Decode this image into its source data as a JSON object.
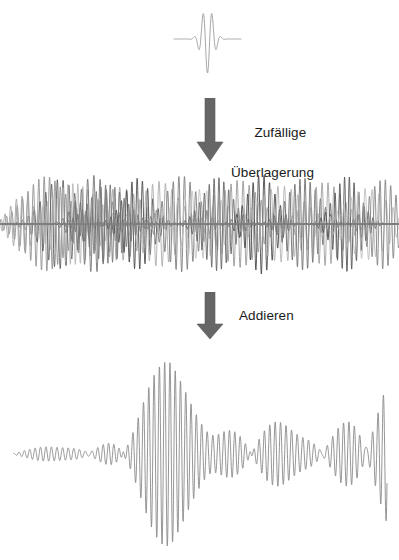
{
  "figure": {
    "background": "#ffffff",
    "width": 399,
    "height": 560
  },
  "labels": {
    "superposition_line1": "Zufällige",
    "superposition_line2": "Überlagerung",
    "add": "Addieren"
  },
  "arrows": {
    "color": "#5e5e5e",
    "shaft_color": "#6b6b6b",
    "first_name": "down-arrow-superposition",
    "second_name": "down-arrow-add"
  },
  "chart_data": {
    "type": "line",
    "xlabel": "",
    "ylabel": "",
    "grid": false,
    "legend": false,
    "panels": [
      {
        "name": "single-wave-packet",
        "description": "Einzelnes Wellenpaket (gaussförmig moduliert)",
        "color": "#9a9a9a",
        "x_range": [
          0,
          1
        ],
        "y_range": [
          -1,
          1
        ],
        "center": 0.5,
        "envelope_width": 0.17,
        "cycles": 7.5,
        "phase": 0.0,
        "amplitude": 1.0,
        "samples": 420
      },
      {
        "name": "random-superposition-band",
        "description": "Viele zufällig überlagerte Wellenpakete in Graustufen",
        "x_range": [
          0,
          1
        ],
        "y_range": [
          -1,
          1
        ],
        "samples": 1400,
        "packets": [
          {
            "color": "#8d8d8d",
            "center": 0.115,
            "envelope_width": 0.105,
            "cycles": 74,
            "phase": 0.35,
            "amplitude": 0.93
          },
          {
            "color": "#5a5a5a",
            "center": 0.15,
            "envelope_width": 0.085,
            "cycles": 69,
            "phase": 2.1,
            "amplitude": 0.88
          },
          {
            "color": "#b3b3b3",
            "center": 0.185,
            "envelope_width": 0.12,
            "cycles": 80,
            "phase": 4.05,
            "amplitude": 0.8
          },
          {
            "color": "#6f6f6f",
            "center": 0.235,
            "envelope_width": 0.075,
            "cycles": 64,
            "phase": 1.2,
            "amplitude": 0.96
          },
          {
            "color": "#9e9e9e",
            "center": 0.3,
            "envelope_width": 0.11,
            "cycles": 58,
            "phase": 5.3,
            "amplitude": 0.72
          },
          {
            "color": "#454545",
            "center": 0.345,
            "envelope_width": 0.07,
            "cycles": 76,
            "phase": 0.8,
            "amplitude": 0.9
          },
          {
            "color": "#a8a8a8",
            "center": 0.4,
            "envelope_width": 0.095,
            "cycles": 62,
            "phase": 3.4,
            "amplitude": 0.84
          },
          {
            "color": "#787878",
            "center": 0.455,
            "envelope_width": 0.08,
            "cycles": 71,
            "phase": 2.65,
            "amplitude": 0.95
          },
          {
            "color": "#c0c0c0",
            "center": 0.5,
            "envelope_width": 0.125,
            "cycles": 55,
            "phase": 4.8,
            "amplitude": 0.68
          },
          {
            "color": "#5f5f5f",
            "center": 0.545,
            "envelope_width": 0.072,
            "cycles": 82,
            "phase": 1.55,
            "amplitude": 0.92
          },
          {
            "color": "#949494",
            "center": 0.6,
            "envelope_width": 0.1,
            "cycles": 66,
            "phase": 0.2,
            "amplitude": 0.86
          },
          {
            "color": "#3f3f3f",
            "center": 0.655,
            "envelope_width": 0.068,
            "cycles": 73,
            "phase": 5.9,
            "amplitude": 0.98
          },
          {
            "color": "#aeaeae",
            "center": 0.705,
            "envelope_width": 0.115,
            "cycles": 60,
            "phase": 2.95,
            "amplitude": 0.75
          },
          {
            "color": "#6a6a6a",
            "center": 0.76,
            "envelope_width": 0.078,
            "cycles": 78,
            "phase": 3.85,
            "amplitude": 0.91
          },
          {
            "color": "#9b9b9b",
            "center": 0.815,
            "envelope_width": 0.092,
            "cycles": 67,
            "phase": 1.05,
            "amplitude": 0.82
          },
          {
            "color": "#515151",
            "center": 0.87,
            "envelope_width": 0.065,
            "cycles": 84,
            "phase": 4.45,
            "amplitude": 0.94
          },
          {
            "color": "#bcbcbc",
            "center": 0.92,
            "envelope_width": 0.105,
            "cycles": 57,
            "phase": 0.6,
            "amplitude": 0.7
          },
          {
            "color": "#808080",
            "center": 0.96,
            "envelope_width": 0.07,
            "cycles": 75,
            "phase": 5.1,
            "amplitude": 0.88
          },
          {
            "color": "#a0a0a0",
            "center": 0.055,
            "envelope_width": 0.06,
            "cycles": 70,
            "phase": 2.4,
            "amplitude": 0.55
          },
          {
            "color": "#707070",
            "center": 0.27,
            "envelope_width": 0.09,
            "cycles": 86,
            "phase": 3.1,
            "amplitude": 0.78
          }
        ]
      },
      {
        "name": "summed-wave",
        "description": "Summe aller Wellenpakete - Schwebungsmuster",
        "color": "#8a8a8a",
        "x_range": [
          0,
          1
        ],
        "y_range": [
          -1,
          1
        ],
        "samples": 2000,
        "components": [
          {
            "freq": 70.0,
            "phase": 0.0,
            "weight": 1.0
          },
          {
            "freq": 71.5,
            "phase": 1.9,
            "weight": 0.88
          },
          {
            "freq": 68.5,
            "phase": 3.6,
            "weight": 0.82
          },
          {
            "freq": 73.0,
            "phase": 5.05,
            "weight": 0.7
          },
          {
            "freq": 66.8,
            "phase": 2.35,
            "weight": 0.64
          },
          {
            "freq": 74.6,
            "phase": 0.85,
            "weight": 0.52
          },
          {
            "freq": 65.2,
            "phase": 4.4,
            "weight": 0.46
          }
        ],
        "envelope_note": "Amplitude wächst von links nach rechts mit Schwebungsknoten"
      }
    ]
  }
}
